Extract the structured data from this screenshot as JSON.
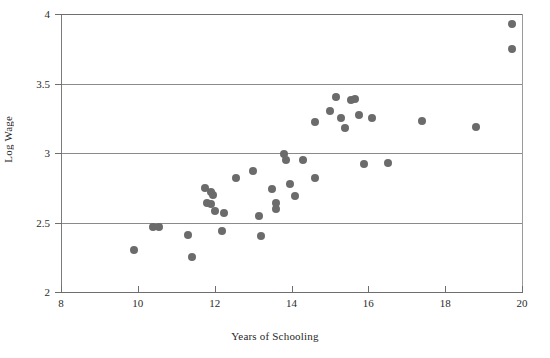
{
  "chart_data": {
    "type": "scatter",
    "title": "",
    "xlabel": "Years of Schooling",
    "ylabel": "Log Wage",
    "xlim": [
      8,
      20
    ],
    "ylim": [
      2,
      4
    ],
    "xticks": [
      8,
      10,
      12,
      14,
      16,
      18,
      20
    ],
    "xtick_labels": [
      "8",
      "10",
      "12",
      "14",
      "16",
      "18",
      "20"
    ],
    "yticks": [
      2,
      2.5,
      3,
      3.5,
      4
    ],
    "ytick_labels": [
      "2",
      "2.5",
      "3",
      "3.5",
      "4"
    ],
    "grid": "horizontal",
    "legend": "none",
    "marker": {
      "shape": "circle",
      "color": "#6b6b6b",
      "size": 8
    },
    "points": [
      {
        "x": 9.9,
        "y": 2.3
      },
      {
        "x": 10.4,
        "y": 2.47
      },
      {
        "x": 10.55,
        "y": 2.47
      },
      {
        "x": 11.3,
        "y": 2.41
      },
      {
        "x": 11.4,
        "y": 2.25
      },
      {
        "x": 11.75,
        "y": 2.75
      },
      {
        "x": 11.8,
        "y": 2.64
      },
      {
        "x": 11.9,
        "y": 2.72
      },
      {
        "x": 11.95,
        "y": 2.7
      },
      {
        "x": 11.9,
        "y": 2.63
      },
      {
        "x": 12.0,
        "y": 2.58
      },
      {
        "x": 12.2,
        "y": 2.44
      },
      {
        "x": 12.25,
        "y": 2.57
      },
      {
        "x": 12.55,
        "y": 2.82
      },
      {
        "x": 13.0,
        "y": 2.87
      },
      {
        "x": 13.15,
        "y": 2.55
      },
      {
        "x": 13.2,
        "y": 2.4
      },
      {
        "x": 13.5,
        "y": 2.74
      },
      {
        "x": 13.6,
        "y": 2.64
      },
      {
        "x": 13.6,
        "y": 2.6
      },
      {
        "x": 13.8,
        "y": 2.99
      },
      {
        "x": 13.85,
        "y": 2.95
      },
      {
        "x": 13.95,
        "y": 2.78
      },
      {
        "x": 14.1,
        "y": 2.69
      },
      {
        "x": 14.3,
        "y": 2.95
      },
      {
        "x": 14.6,
        "y": 2.82
      },
      {
        "x": 14.6,
        "y": 3.22
      },
      {
        "x": 15.0,
        "y": 3.3
      },
      {
        "x": 15.15,
        "y": 3.4
      },
      {
        "x": 15.3,
        "y": 3.25
      },
      {
        "x": 15.4,
        "y": 3.18
      },
      {
        "x": 15.55,
        "y": 3.38
      },
      {
        "x": 15.65,
        "y": 3.39
      },
      {
        "x": 15.75,
        "y": 3.27
      },
      {
        "x": 15.9,
        "y": 2.92
      },
      {
        "x": 16.1,
        "y": 3.25
      },
      {
        "x": 16.5,
        "y": 2.93
      },
      {
        "x": 17.4,
        "y": 3.23
      },
      {
        "x": 18.8,
        "y": 3.19
      },
      {
        "x": 19.75,
        "y": 3.93
      },
      {
        "x": 19.75,
        "y": 3.75
      }
    ]
  }
}
